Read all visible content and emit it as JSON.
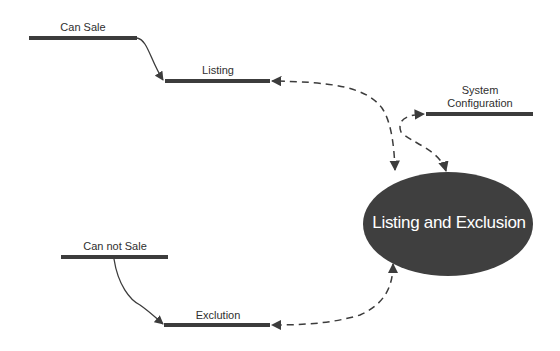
{
  "diagram": {
    "colors": {
      "stroke": "#3c3c3c",
      "ellipse_fill": "#3f3f3f",
      "ellipse_text": "#ffffff",
      "background": "#ffffff"
    },
    "nodes": {
      "can_sale": {
        "label": "Can Sale"
      },
      "listing": {
        "label": "Listing"
      },
      "system_configuration": {
        "label_line1": "System",
        "label_line2": "Configuration"
      },
      "listing_and_exclusion": {
        "label": "Listing and Exclusion"
      },
      "can_not_sale": {
        "label": "Can not Sale"
      },
      "exclution": {
        "label": "Exclution"
      }
    },
    "edges": [
      {
        "from": "Can Sale",
        "to": "Listing",
        "style": "solid"
      },
      {
        "from": "Listing and Exclusion",
        "to": "Listing",
        "style": "dashed",
        "bidirectional": true
      },
      {
        "from": "Listing and Exclusion",
        "to": "System Configuration",
        "style": "dashed",
        "bidirectional": true
      },
      {
        "from": "Can not Sale",
        "to": "Exclution",
        "style": "solid"
      },
      {
        "from": "Listing and Exclusion",
        "to": "Exclution",
        "style": "dashed",
        "bidirectional": true
      }
    ]
  }
}
